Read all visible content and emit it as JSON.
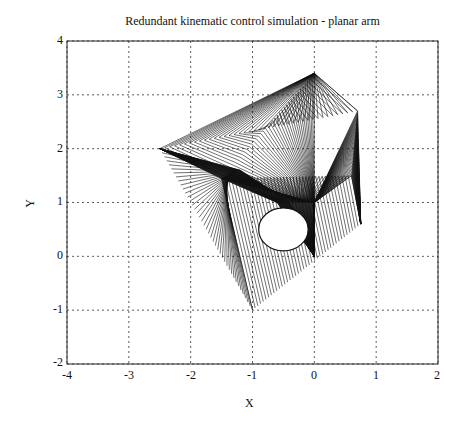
{
  "chart_data": {
    "type": "line",
    "title": "Redundant kinematic control simulation - planar arm",
    "xlabel": "X",
    "ylabel": "Y",
    "xlim": [
      -4,
      2
    ],
    "ylim": [
      -2,
      4
    ],
    "xticks": [
      -4,
      -3,
      -2,
      -1,
      0,
      1,
      2
    ],
    "yticks": [
      -2,
      -1,
      0,
      1,
      2,
      3,
      4
    ],
    "grid": true,
    "grid_style": "dotted",
    "series": [
      {
        "name": "arm configurations sweep (envelope key points)",
        "points": [
          {
            "x": 0.0,
            "y": 0.0
          },
          {
            "x": 0.0,
            "y": 3.4
          },
          {
            "x": 0.7,
            "y": 2.7
          },
          {
            "x": -2.5,
            "y": 2.0
          },
          {
            "x": -1.0,
            "y": -1.0
          },
          {
            "x": 0.75,
            "y": 0.6
          },
          {
            "x": 0.0,
            "y": 1.0
          },
          {
            "x": -1.5,
            "y": 1.45
          }
        ]
      }
    ],
    "obstacle": {
      "shape": "circle",
      "cx": -0.5,
      "cy": 0.5,
      "r": 0.4
    },
    "annotations": []
  },
  "labels": {
    "title": "Redundant kinematic control simulation - planar arm",
    "x": "X",
    "y": "Y",
    "xticks": [
      "-4",
      "-3",
      "-2",
      "-1",
      "0",
      "1",
      "2"
    ],
    "yticks": [
      "4",
      "3",
      "2",
      "1",
      "0",
      "-1",
      "-2"
    ]
  }
}
